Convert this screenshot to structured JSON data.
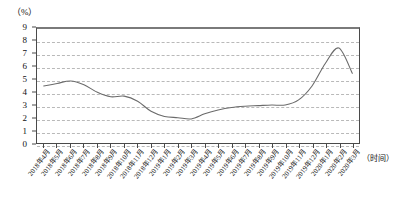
{
  "chart_data": {
    "type": "line",
    "title": "",
    "subtitle": "",
    "xlabel": "（时间）",
    "ylabel": "（%）",
    "unit_label": "（%）",
    "ylim": [
      0,
      9
    ],
    "y_ticks": [
      0,
      1,
      2,
      3,
      4,
      5,
      6,
      7,
      8,
      9
    ],
    "grid": true,
    "legend": "none",
    "line_color": "#6b6b6b",
    "categories": [
      "2018年4月",
      "2018年5月",
      "2018年6月",
      "2018年7月",
      "2018年8月",
      "2018年9月",
      "2018年10月",
      "2018年11月",
      "2018年12月",
      "2019年1月",
      "2019年2月",
      "2019年3月",
      "2019年4月",
      "2019年5月",
      "2019年6月",
      "2019年7月",
      "2019年8月",
      "2019年9月",
      "2019年10月",
      "2019年11月",
      "2019年12月",
      "2020年1月",
      "2020年2月",
      "2020年3月"
    ],
    "values": [
      4.5,
      4.7,
      4.9,
      4.6,
      4.0,
      3.65,
      3.7,
      3.3,
      2.5,
      2.1,
      2.0,
      1.9,
      2.3,
      2.6,
      2.8,
      2.9,
      2.95,
      3.0,
      3.0,
      3.4,
      4.5,
      6.3,
      7.5,
      5.5
    ]
  }
}
